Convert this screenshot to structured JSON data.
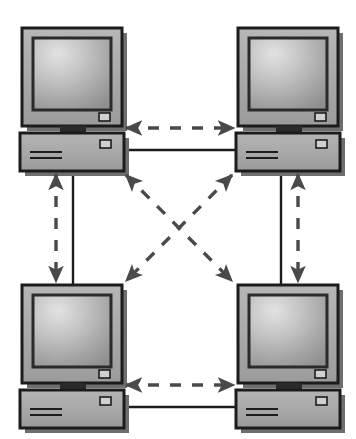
{
  "figure": {
    "type": "network-topology-diagram",
    "canvas": {
      "width": 356,
      "height": 439,
      "background": "#ffffff"
    }
  },
  "palette": {
    "case_fill": "#a8a8a8",
    "case_fill_light": "#b4b4b4",
    "outline": "#1c1c1c",
    "screen_light": "#d8d8d8",
    "screen_mid": "#a9a9a9",
    "screen_dark": "#8f8f8f",
    "screen_bezel": "#2a2a2a",
    "arrow": "#4a4a4a",
    "solid_link": "#1c1c1c",
    "shadow": "#6e6e6e",
    "button_fill": "#d0d0d0"
  },
  "nodes": [
    {
      "id": "node-top-left",
      "name": "computer-top-left",
      "label": "Computer (top left)",
      "position": "top-left",
      "monitor": {
        "x": 22,
        "y": 28,
        "width": 100,
        "height": 98
      },
      "screen": {
        "x": 33,
        "y": 38,
        "width": 78,
        "height": 72
      },
      "power_button": {
        "x": 99,
        "y": 113,
        "width": 11,
        "height": 8
      },
      "stand": {
        "x": 60,
        "y": 126,
        "width": 26,
        "height": 7
      },
      "cpu": {
        "x": 20,
        "y": 133,
        "width": 104,
        "height": 38
      },
      "cpu_button": {
        "x": 100,
        "y": 140,
        "width": 11,
        "height": 8
      },
      "cpu_slots": [
        {
          "x": 30,
          "y": 151,
          "width": 32,
          "height": 2
        },
        {
          "x": 30,
          "y": 157,
          "width": 32,
          "height": 2
        }
      ]
    },
    {
      "id": "node-top-right",
      "name": "computer-top-right",
      "label": "Computer (top right)",
      "position": "top-right",
      "monitor": {
        "x": 238,
        "y": 28,
        "width": 100,
        "height": 98
      },
      "screen": {
        "x": 249,
        "y": 38,
        "width": 78,
        "height": 72
      },
      "power_button": {
        "x": 315,
        "y": 113,
        "width": 11,
        "height": 8
      },
      "stand": {
        "x": 276,
        "y": 126,
        "width": 26,
        "height": 7
      },
      "cpu": {
        "x": 236,
        "y": 133,
        "width": 104,
        "height": 38
      },
      "cpu_button": {
        "x": 316,
        "y": 140,
        "width": 11,
        "height": 8
      },
      "cpu_slots": [
        {
          "x": 246,
          "y": 151,
          "width": 32,
          "height": 2
        },
        {
          "x": 246,
          "y": 157,
          "width": 32,
          "height": 2
        }
      ]
    },
    {
      "id": "node-bottom-left",
      "name": "computer-bottom-left",
      "label": "Computer (bottom left)",
      "position": "bottom-left",
      "monitor": {
        "x": 22,
        "y": 285,
        "width": 100,
        "height": 98
      },
      "screen": {
        "x": 33,
        "y": 295,
        "width": 78,
        "height": 72
      },
      "power_button": {
        "x": 99,
        "y": 370,
        "width": 11,
        "height": 8
      },
      "stand": {
        "x": 60,
        "y": 383,
        "width": 26,
        "height": 7
      },
      "cpu": {
        "x": 20,
        "y": 390,
        "width": 104,
        "height": 38
      },
      "cpu_button": {
        "x": 100,
        "y": 397,
        "width": 11,
        "height": 8
      },
      "cpu_slots": [
        {
          "x": 30,
          "y": 408,
          "width": 32,
          "height": 2
        },
        {
          "x": 30,
          "y": 414,
          "width": 32,
          "height": 2
        }
      ]
    },
    {
      "id": "node-bottom-right",
      "name": "computer-bottom-right",
      "label": "Computer (bottom right)",
      "position": "bottom-right",
      "monitor": {
        "x": 238,
        "y": 285,
        "width": 100,
        "height": 98
      },
      "screen": {
        "x": 249,
        "y": 295,
        "width": 78,
        "height": 72
      },
      "power_button": {
        "x": 315,
        "y": 370,
        "width": 11,
        "height": 8
      },
      "stand": {
        "x": 276,
        "y": 383,
        "width": 26,
        "height": 7
      },
      "cpu": {
        "x": 236,
        "y": 390,
        "width": 104,
        "height": 38
      },
      "cpu_button": {
        "x": 316,
        "y": 397,
        "width": 11,
        "height": 8
      },
      "cpu_slots": [
        {
          "x": 246,
          "y": 408,
          "width": 32,
          "height": 2
        },
        {
          "x": 246,
          "y": 414,
          "width": 32,
          "height": 2
        }
      ]
    }
  ],
  "solid_links": [
    {
      "id": "link-top-horizontal",
      "name": "solid-link-top-horizontal",
      "label": "Top cable: top-left CPU to top-right CPU",
      "style": "solid",
      "x1": 124,
      "y1": 150,
      "x2": 236,
      "y2": 150
    },
    {
      "id": "link-bottom-horizontal",
      "name": "solid-link-bottom-horizontal",
      "label": "Bottom cable: bottom-left CPU to bottom-right CPU",
      "style": "solid",
      "x1": 124,
      "y1": 407,
      "x2": 236,
      "y2": 407
    },
    {
      "id": "link-left-vertical",
      "name": "solid-link-left-vertical",
      "label": "Left cable: top-left CPU down to bottom-left monitor",
      "style": "solid",
      "x1": 73,
      "y1": 171,
      "x2": 73,
      "y2": 285
    },
    {
      "id": "link-right-vertical",
      "name": "solid-link-right-vertical",
      "label": "Right cable: top-right CPU down to bottom-right monitor",
      "style": "solid",
      "x1": 281,
      "y1": 171,
      "x2": 281,
      "y2": 285
    }
  ],
  "dashed_arrows": [
    {
      "id": "arrow-top",
      "name": "dashed-arrow-top-horizontal",
      "label": "Bidirectional data flow: top-left to top-right",
      "style": "dashed",
      "direction": "bidirectional",
      "x1": 126,
      "y1": 128,
      "x2": 234,
      "y2": 128
    },
    {
      "id": "arrow-bottom",
      "name": "dashed-arrow-bottom-horizontal",
      "label": "Bidirectional data flow: bottom-left to bottom-right",
      "style": "dashed",
      "direction": "bidirectional",
      "x1": 126,
      "y1": 385,
      "x2": 234,
      "y2": 385
    },
    {
      "id": "arrow-left",
      "name": "dashed-arrow-left-vertical",
      "label": "Bidirectional data flow: top-left to bottom-left",
      "style": "dashed",
      "direction": "bidirectional",
      "x1": 56,
      "y1": 174,
      "x2": 56,
      "y2": 282
    },
    {
      "id": "arrow-right",
      "name": "dashed-arrow-right-vertical",
      "label": "Bidirectional data flow: top-right to bottom-right",
      "style": "dashed",
      "direction": "bidirectional",
      "x1": 298,
      "y1": 174,
      "x2": 298,
      "y2": 282
    },
    {
      "id": "arrow-diagonal-nw-se",
      "name": "dashed-arrow-diagonal-nw-se",
      "label": "Bidirectional data flow: top-left to bottom-right",
      "style": "dashed",
      "direction": "bidirectional",
      "x1": 126,
      "y1": 175,
      "x2": 232,
      "y2": 281
    },
    {
      "id": "arrow-diagonal-ne-sw",
      "name": "dashed-arrow-diagonal-ne-sw",
      "label": "Bidirectional data flow: top-right to bottom-left",
      "style": "dashed",
      "direction": "bidirectional",
      "x1": 232,
      "y1": 175,
      "x2": 126,
      "y2": 281
    }
  ]
}
